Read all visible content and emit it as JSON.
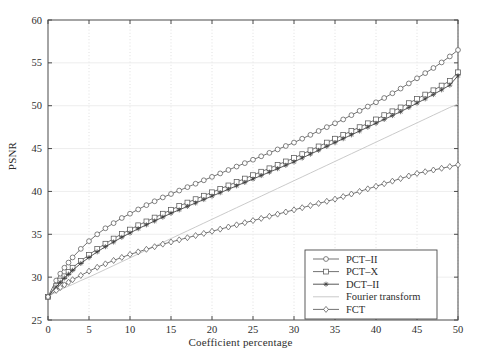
{
  "chart_data": {
    "type": "line",
    "title": "",
    "xlabel": "Coefficient percentage",
    "ylabel": "PSNR",
    "xlim": [
      0,
      50
    ],
    "ylim": [
      25,
      60
    ],
    "xticks": [
      0,
      5,
      10,
      15,
      20,
      25,
      30,
      35,
      40,
      45,
      50
    ],
    "yticks": [
      25,
      30,
      35,
      40,
      45,
      50,
      55,
      60
    ],
    "xtick_labels": [
      "0",
      "5",
      "10",
      "15",
      "20",
      "25",
      "30",
      "35",
      "40",
      "45",
      "50"
    ],
    "ytick_labels": [
      "25",
      "30",
      "35",
      "40",
      "45",
      "50",
      "55",
      "60"
    ],
    "grid": true,
    "legend_position": "lower right",
    "x": [
      0,
      0.5,
      1,
      1.5,
      2,
      2.5,
      3,
      4,
      5,
      6,
      7,
      8,
      9,
      10,
      11,
      12,
      13,
      14,
      15,
      16,
      17,
      18,
      19,
      20,
      21,
      22,
      23,
      24,
      25,
      26,
      27,
      28,
      29,
      30,
      31,
      32,
      33,
      34,
      35,
      36,
      37,
      38,
      39,
      40,
      41,
      42,
      43,
      44,
      45,
      46,
      47,
      48,
      49,
      50
    ],
    "series": [
      {
        "name": "PCT–II",
        "marker": "circle",
        "color": "#5a5a5a",
        "values": [
          27.7,
          28.7,
          29.6,
          30.4,
          31.1,
          31.7,
          32.3,
          33.3,
          34.2,
          35.0,
          35.7,
          36.3,
          36.9,
          37.4,
          37.9,
          38.4,
          38.85,
          39.3,
          39.7,
          40.1,
          40.5,
          40.9,
          41.3,
          41.7,
          42.1,
          42.5,
          42.9,
          43.3,
          43.7,
          44.1,
          44.5,
          44.9,
          45.3,
          45.7,
          46.15,
          46.6,
          47.05,
          47.5,
          47.95,
          48.4,
          48.9,
          49.4,
          49.9,
          50.4,
          50.9,
          51.45,
          52.0,
          52.6,
          53.2,
          53.8,
          54.4,
          55.05,
          55.75,
          56.5
        ]
      },
      {
        "name": "PCT–X",
        "marker": "square",
        "color": "#5a5a5a",
        "values": [
          27.7,
          28.4,
          29.0,
          29.6,
          30.1,
          30.6,
          31.1,
          31.9,
          32.6,
          33.3,
          33.9,
          34.5,
          35.05,
          35.55,
          36.05,
          36.5,
          36.95,
          37.4,
          37.85,
          38.3,
          38.7,
          39.1,
          39.5,
          39.9,
          40.3,
          40.7,
          41.1,
          41.5,
          41.9,
          42.3,
          42.7,
          43.1,
          43.5,
          43.9,
          44.35,
          44.8,
          45.25,
          45.7,
          46.15,
          46.6,
          47.05,
          47.5,
          47.95,
          48.4,
          48.9,
          49.35,
          49.8,
          50.3,
          50.8,
          51.3,
          51.8,
          52.35,
          52.9,
          53.9
        ]
      },
      {
        "name": "DCT–II",
        "marker": "star",
        "color": "#3a3a3a",
        "values": [
          27.7,
          28.3,
          28.85,
          29.4,
          29.9,
          30.35,
          30.8,
          31.6,
          32.3,
          32.95,
          33.55,
          34.1,
          34.65,
          35.15,
          35.65,
          36.1,
          36.55,
          37.0,
          37.45,
          37.85,
          38.25,
          38.65,
          39.05,
          39.45,
          39.85,
          40.25,
          40.65,
          41.05,
          41.45,
          41.85,
          42.25,
          42.65,
          43.05,
          43.45,
          43.9,
          44.35,
          44.8,
          45.25,
          45.7,
          46.15,
          46.6,
          47.05,
          47.5,
          47.95,
          48.4,
          48.85,
          49.3,
          49.8,
          50.3,
          50.8,
          51.3,
          51.85,
          52.4,
          53.5
        ]
      },
      {
        "name": "Fourier transform",
        "marker": "none",
        "color": "#c4c4c4",
        "values": [
          27.7,
          28.0,
          28.25,
          28.5,
          28.75,
          28.95,
          29.15,
          29.6,
          30.0,
          30.45,
          30.9,
          31.35,
          31.8,
          32.25,
          32.7,
          33.15,
          33.6,
          34.05,
          34.5,
          34.95,
          35.4,
          35.85,
          36.3,
          36.75,
          37.2,
          37.65,
          38.1,
          38.55,
          39.0,
          39.45,
          39.9,
          40.35,
          40.8,
          41.25,
          41.7,
          42.15,
          42.6,
          43.05,
          43.5,
          43.95,
          44.4,
          44.85,
          45.3,
          45.75,
          46.2,
          46.65,
          47.1,
          47.55,
          48.0,
          48.45,
          48.9,
          49.35,
          49.8,
          50.2
        ]
      },
      {
        "name": "FCT",
        "marker": "diamond",
        "color": "#5a5a5a",
        "values": [
          27.7,
          28.1,
          28.45,
          28.8,
          29.1,
          29.4,
          29.7,
          30.2,
          30.7,
          31.15,
          31.55,
          31.95,
          32.3,
          32.65,
          32.95,
          33.25,
          33.55,
          33.85,
          34.1,
          34.35,
          34.6,
          34.85,
          35.1,
          35.35,
          35.6,
          35.85,
          36.1,
          36.35,
          36.6,
          36.85,
          37.1,
          37.35,
          37.6,
          37.85,
          38.1,
          38.35,
          38.6,
          38.85,
          39.1,
          39.4,
          39.7,
          40.0,
          40.3,
          40.6,
          40.9,
          41.2,
          41.5,
          41.8,
          42.1,
          42.3,
          42.5,
          42.7,
          42.9,
          43.1
        ]
      }
    ],
    "legend": [
      {
        "label": "PCT–II",
        "marker": "circle"
      },
      {
        "label": "PCT–X",
        "marker": "square"
      },
      {
        "label": "DCT–II",
        "marker": "star"
      },
      {
        "label": "Fourier transform",
        "marker": "none"
      },
      {
        "label": "FCT",
        "marker": "diamond"
      }
    ]
  },
  "colors": {
    "axis": "#4a4a4a",
    "grid": "#d8d8d8",
    "background": "#ffffff",
    "line_dark": "#3a3a3a",
    "line_mid": "#5a5a5a",
    "line_light": "#c4c4c4"
  }
}
